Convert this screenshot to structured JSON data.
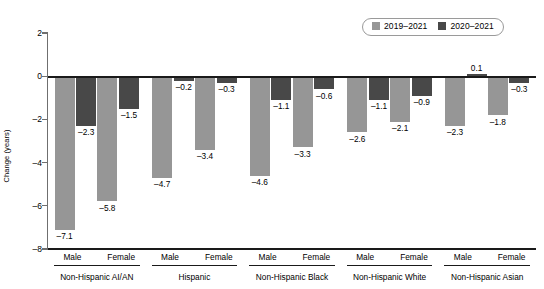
{
  "chart_data": {
    "type": "bar",
    "title": "",
    "subtitle": "",
    "xlabel": "",
    "ylabel": "Change (years)",
    "ylim": [
      -8,
      2
    ],
    "yticks": [
      2,
      0,
      -2,
      -4,
      -6,
      -8
    ],
    "ytick_labels": [
      "2",
      "0",
      "–2",
      "–4",
      "–6",
      "–8"
    ],
    "grid": false,
    "legend_position": "top-right",
    "orientation": "vertical",
    "zero_line": 0,
    "colors": {
      "series_2019_2021": "#969696",
      "series_2020_2021": "#484848",
      "axis": "#1a1a1a",
      "y_axis": "#6f6f6f",
      "legend_border": "#9a9a9a",
      "background": "#ffffff"
    },
    "legend": [
      {
        "label": "2019–2021",
        "color": "#969696"
      },
      {
        "label": "2020–2021",
        "color": "#484848"
      }
    ],
    "series": [
      {
        "name": "2019–2021",
        "color": "#969696",
        "values": [
          -7.1,
          -5.8,
          -4.7,
          -3.4,
          -4.6,
          -3.3,
          -2.6,
          -2.1,
          -2.3,
          -1.8
        ],
        "labels": [
          "–7.1",
          "–5.8",
          "–4.7",
          "–3.4",
          "–4.6",
          "–3.3",
          "–2.6",
          "–2.1",
          "–2.3",
          "–1.8"
        ]
      },
      {
        "name": "2020–2021",
        "color": "#484848",
        "values": [
          -2.3,
          -1.5,
          -0.2,
          -0.3,
          -1.1,
          -0.6,
          -1.1,
          -0.9,
          0.1,
          -0.3
        ],
        "labels": [
          "–2.3",
          "–1.5",
          "–0.2",
          "–0.3",
          "–1.1",
          "–0.6",
          "–1.1",
          "–0.9",
          "0.1",
          "–0.3"
        ]
      }
    ],
    "categories": [
      "Non-Hispanic AI/AN Male",
      "Non-Hispanic AI/AN Female",
      "Hispanic Male",
      "Hispanic Female",
      "Non-Hispanic Black Male",
      "Non-Hispanic Black Female",
      "Non-Hispanic White Male",
      "Non-Hispanic White Female",
      "Non-Hispanic Asian Male",
      "Non-Hispanic Asian Female"
    ],
    "groups": [
      {
        "name": "Non-Hispanic AI/AN",
        "sexes": [
          "Male",
          "Female"
        ]
      },
      {
        "name": "Hispanic",
        "sexes": [
          "Male",
          "Female"
        ]
      },
      {
        "name": "Non-Hispanic Black",
        "sexes": [
          "Male",
          "Female"
        ]
      },
      {
        "name": "Non-Hispanic White",
        "sexes": [
          "Male",
          "Female"
        ]
      },
      {
        "name": "Non-Hispanic Asian",
        "sexes": [
          "Male",
          "Female"
        ]
      }
    ]
  }
}
